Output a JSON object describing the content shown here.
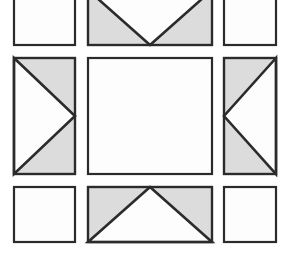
{
  "figure": {
    "background_color": "#ffffff",
    "canvas": {
      "width": 287,
      "height": 260
    }
  },
  "style": {
    "fill_white": "#fdfdfd",
    "fill_gray": "#dcdcdc",
    "stroke_color": "#2b2b2b",
    "stroke_width": 2.2,
    "inner_stroke_width": 2.6
  },
  "grid": {
    "columns": 3,
    "rows": 3,
    "column_x": [
      14,
      88,
      224
    ],
    "column_width": [
      61,
      124,
      52
    ],
    "row_y": [
      -10,
      58,
      187
    ],
    "row_height": [
      55,
      116,
      55
    ],
    "gap_x": 13,
    "gap_y": 13
  },
  "cells": [
    {
      "id": "cell-top-left",
      "name": "top-left-plain-tile",
      "row": 0,
      "col": 0,
      "x": 14,
      "y": -10,
      "w": 61,
      "h": 55,
      "fill": "white",
      "shape": "plain",
      "arrow": "none",
      "clipped_top": true
    },
    {
      "id": "cell-top-center",
      "name": "top-center-arrow-down-tile",
      "row": 0,
      "col": 1,
      "x": 88,
      "y": -10,
      "w": 124,
      "h": 55,
      "fill": "gray",
      "shape": "triangle",
      "arrow": "down",
      "triangle_points": "0,0 1,0 0.5,1",
      "clipped_top": true
    },
    {
      "id": "cell-top-right",
      "name": "top-right-plain-tile",
      "row": 0,
      "col": 2,
      "x": 224,
      "y": -10,
      "w": 52,
      "h": 55,
      "fill": "white",
      "shape": "plain",
      "arrow": "none",
      "clipped_top": true
    },
    {
      "id": "cell-middle-left",
      "name": "middle-left-arrow-right-tile",
      "row": 1,
      "col": 0,
      "x": 14,
      "y": 58,
      "w": 61,
      "h": 116,
      "fill": "gray",
      "shape": "triangle",
      "arrow": "right",
      "triangle_points": "0,0 1,0.5 0,1",
      "clipped_top": false
    },
    {
      "id": "cell-center",
      "name": "center-plain-tile",
      "row": 1,
      "col": 1,
      "x": 88,
      "y": 58,
      "w": 124,
      "h": 116,
      "fill": "white",
      "shape": "plain",
      "arrow": "none",
      "clipped_top": false
    },
    {
      "id": "cell-middle-right",
      "name": "middle-right-arrow-left-tile",
      "row": 1,
      "col": 2,
      "x": 224,
      "y": 58,
      "w": 52,
      "h": 116,
      "fill": "gray",
      "shape": "triangle",
      "arrow": "left",
      "triangle_points": "1,0 0,0.5 1,1",
      "clipped_top": false
    },
    {
      "id": "cell-bottom-left",
      "name": "bottom-left-plain-tile",
      "row": 2,
      "col": 0,
      "x": 14,
      "y": 187,
      "w": 61,
      "h": 55,
      "fill": "white",
      "shape": "plain",
      "arrow": "none",
      "clipped_top": false
    },
    {
      "id": "cell-bottom-center",
      "name": "bottom-center-arrow-up-tile",
      "row": 2,
      "col": 1,
      "x": 88,
      "y": 187,
      "w": 124,
      "h": 55,
      "fill": "gray",
      "shape": "triangle",
      "arrow": "up",
      "triangle_points": "0.5,0 1,1 0,1",
      "clipped_top": false
    },
    {
      "id": "cell-bottom-right",
      "name": "bottom-right-plain-tile",
      "row": 2,
      "col": 2,
      "x": 224,
      "y": 187,
      "w": 52,
      "h": 55,
      "fill": "white",
      "shape": "plain",
      "arrow": "none",
      "clipped_top": false
    }
  ]
}
